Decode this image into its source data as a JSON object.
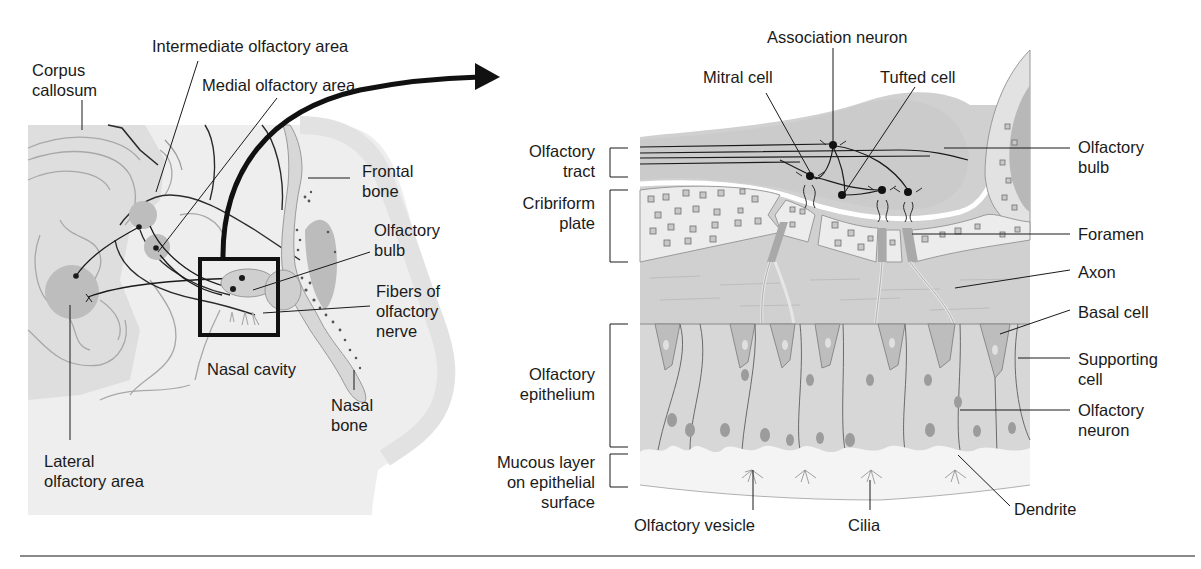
{
  "figure": {
    "topic": "Olfactory pathway anatomy",
    "panels": [
      {
        "id": "head-sagittal-section",
        "description": "Sagittal section of head showing olfactory areas of brain and olfactory bulb above nasal cavity"
      },
      {
        "id": "magnified-olfactory-epithelium",
        "description": "Enlarged view of boxed region: olfactory bulb, cribriform plate and olfactory epithelium"
      }
    ],
    "colors": {
      "tissue_light": "#e6e6e6",
      "tissue_mid": "#cfcfcf",
      "tissue_dark": "#b4b4b4",
      "bone_fill": "#ebebeb",
      "line": "#1a1a1a",
      "outline_gray": "#8c8c8c",
      "background": "#ffffff"
    }
  },
  "left_panel": {
    "labels": {
      "corpus_callosum": "Corpus\ncallosum",
      "intermediate_olfactory_area": "Intermediate olfactory area",
      "medial_olfactory_area": "Medial olfactory area",
      "frontal_bone": "Frontal\nbone",
      "olfactory_bulb": "Olfactory\nbulb",
      "fibers_of_olfactory_nerve": "Fibers of\nolfactory\nnerve",
      "nasal_cavity": "Nasal cavity",
      "nasal_bone": "Nasal\nbone",
      "lateral_olfactory_area": "Lateral\nolfactory area"
    }
  },
  "right_panel": {
    "labels": {
      "association_neuron": "Association neuron",
      "mitral_cell": "Mitral cell",
      "tufted_cell": "Tufted cell",
      "olfactory_tract": "Olfactory\ntract",
      "cribriform_plate": "Cribriform\nplate",
      "olfactory_bulb": "Olfactory\nbulb",
      "foramen": "Foramen",
      "axon": "Axon",
      "basal_cell": "Basal cell",
      "supporting_cell": "Supporting\ncell",
      "olfactory_neuron": "Olfactory\nneuron",
      "olfactory_epithelium": "Olfactory\nepithelium",
      "mucous_layer": "Mucous layer\non epithelial\nsurface",
      "olfactory_vesicle": "Olfactory vesicle",
      "cilia": "Cilia",
      "dendrite": "Dendrite"
    }
  }
}
